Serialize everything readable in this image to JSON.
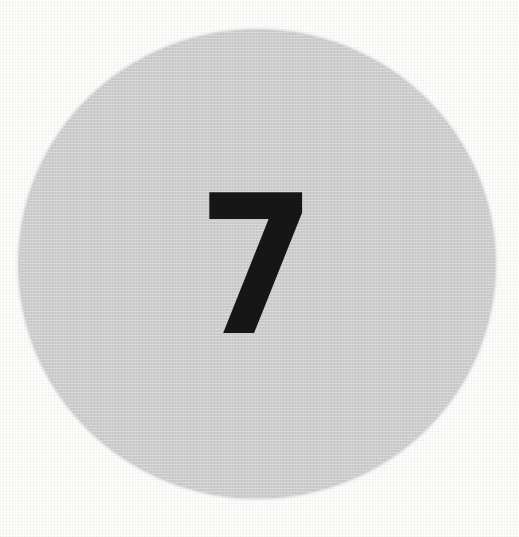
{
  "badge": {
    "number": "7",
    "circle_color": "#cccccc",
    "number_color": "#161616",
    "background_color": "#fdfdfc"
  }
}
